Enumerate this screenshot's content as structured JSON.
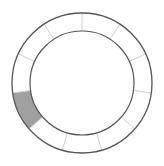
{
  "ring": {
    "segment_count": 11,
    "highlighted_segments": [
      7
    ],
    "center": [
      82,
      83
    ],
    "outer_radius": 70,
    "inner_radius": 52,
    "colors": {
      "background": "#ffffff",
      "highlight_fill": "#a0a0a0",
      "circle_stroke": "#555555",
      "divider_stroke": "#d0d0d0"
    }
  }
}
